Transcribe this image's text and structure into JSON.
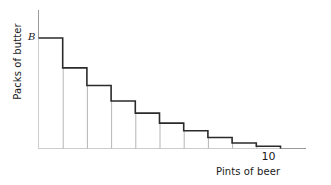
{
  "chart_data": {
    "type": "bar",
    "title": "",
    "subtitle": "",
    "xlabel": "Pints of beer",
    "ylabel": "Packs of butter",
    "categories": [
      "1",
      "2",
      "3",
      "4",
      "5",
      "6",
      "7",
      "8",
      "9",
      "10"
    ],
    "values": [
      10.0,
      7.3,
      5.7,
      4.3,
      3.2,
      2.3,
      1.6,
      1.0,
      0.5,
      0.2
    ],
    "series": [
      {
        "name": "Marginal utility schedule",
        "values": [
          10.0,
          7.3,
          5.7,
          4.3,
          3.2,
          2.3,
          1.6,
          1.0,
          0.5,
          0.2
        ]
      }
    ],
    "x": [
      1,
      2,
      3,
      4,
      5,
      6,
      7,
      8,
      9,
      10
    ],
    "xlim": [
      0,
      11.5
    ],
    "ylim": [
      0,
      11
    ],
    "xticks": [
      "10"
    ],
    "xtick_values": [
      10
    ],
    "yticks": [],
    "grid": false,
    "legend": null,
    "legend_position": "none",
    "annotations": [
      {
        "text": "B",
        "x": 0,
        "y": 10.0,
        "style": "italic",
        "position": "left-of-y-axis-at-first-bar-top",
        "meaning": "starting level of packs of butter"
      }
    ],
    "axis_style": {
      "x_axis_color": "#9a9a9a",
      "y_axis_color": "#9a9a9a",
      "step_outline_color": "#2b2b2b",
      "bar_divider_color": "#b5b5b5",
      "bar_fill_color": "#ffffff",
      "background_color": "#ffffff"
    }
  },
  "colors": {
    "background": "#ffffff",
    "axis": "#9a9a9a",
    "step_outline": "#2b2b2b",
    "divider": "#b5b5b5",
    "text": "#1a1a1a"
  }
}
